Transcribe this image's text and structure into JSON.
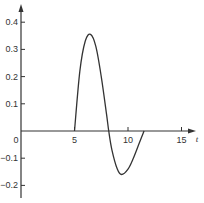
{
  "chart_data": {
    "type": "line",
    "title": "",
    "xlabel": "t",
    "ylabel": "",
    "xlim": [
      0,
      17
    ],
    "ylim": [
      -0.25,
      0.45
    ],
    "grid": false,
    "legend": null,
    "x_ticks": [
      "0",
      "5",
      "10",
      "15"
    ],
    "y_ticks": [
      "0.4",
      "0.3",
      "0.2",
      "0.1",
      "-0.1",
      "-0.2"
    ],
    "origin_label": "0",
    "series": [
      {
        "name": "curve",
        "x": [
          5,
          5.5,
          6,
          6.5,
          7,
          7.5,
          8,
          8.2,
          8.5,
          9,
          9.4,
          10,
          10.5,
          11,
          11.5
        ],
        "y": [
          0,
          0.22,
          0.33,
          0.355,
          0.31,
          0.2,
          0.06,
          0,
          -0.07,
          -0.14,
          -0.16,
          -0.14,
          -0.1,
          -0.05,
          0
        ]
      }
    ]
  }
}
